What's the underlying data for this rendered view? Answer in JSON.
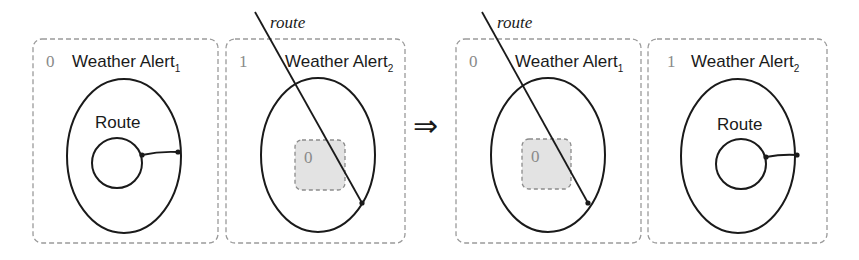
{
  "diagram": {
    "arrow_symbol": "⇒",
    "route_label": "route",
    "before": {
      "panels": [
        {
          "index": "0",
          "title": "Weather Alert",
          "subscript": "1",
          "shape_label": "Route",
          "contents": "outer oval containing an inner circle connected to the oval by a line"
        },
        {
          "index": "1",
          "title": "Weather Alert",
          "subscript": "2",
          "inner_box_index": "0",
          "contents": "oval crossed by route line passing through shaded inner box"
        }
      ]
    },
    "after": {
      "panels": [
        {
          "index": "0",
          "title": "Weather Alert",
          "subscript": "1",
          "inner_box_index": "0",
          "contents": "oval crossed by route line passing through shaded inner box"
        },
        {
          "index": "1",
          "title": "Weather Alert",
          "subscript": "2",
          "shape_label": "Route",
          "contents": "outer oval containing an inner circle connected to the oval by a line"
        }
      ]
    },
    "colors": {
      "stroke": "#1a1a1a",
      "dashed_border": "#9a9a9a",
      "inner_box_fill": "#e3e3e3",
      "index_text": "#8a8a8a"
    }
  }
}
